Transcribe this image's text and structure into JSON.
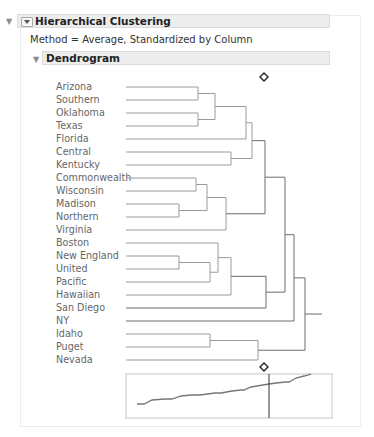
{
  "report": {
    "outer_disclosure_icon": "triangle-down-icon",
    "title": "Hierarchical Clustering",
    "method_text": "Method = Average, Standardized by Column",
    "dendrogram_title": "Dendrogram"
  },
  "chart_data": {
    "type": "dendrogram",
    "title": "Dendrogram",
    "method": "Average, Standardized by Column",
    "leaves": [
      "Arizona",
      "Southern",
      "Oklahoma",
      "Texas",
      "Florida",
      "Central",
      "Kentucky",
      "Commonwealth",
      "Wisconsin",
      "Madison",
      "Northern",
      "Virginia",
      "Boston",
      "New England",
      "United",
      "Pacific",
      "Hawaiian",
      "San Diego",
      "NY",
      "Idaho",
      "Puget",
      "Nevada"
    ],
    "merges": [
      {
        "children": [
          "Arizona",
          "Southern"
        ],
        "height_px": 198
      },
      {
        "children": [
          "Oklahoma",
          "Texas"
        ],
        "height_px": 198
      },
      {
        "children": [
          "Arizona+Southern",
          "Oklahoma+Texas"
        ],
        "height_px": 215
      },
      {
        "children": [
          "AZ-TX group",
          "Florida"
        ],
        "height_px": 246
      },
      {
        "children": [
          "Central",
          "Kentucky"
        ],
        "height_px": 231
      },
      {
        "children": [
          "AZ-FL group",
          "Central+Kentucky"
        ],
        "height_px": 252
      },
      {
        "children": [
          "Commonwealth",
          "Wisconsin"
        ],
        "height_px": 196
      },
      {
        "children": [
          "Madison",
          "Northern"
        ],
        "height_px": 179
      },
      {
        "children": [
          "Commonwealth+Wisconsin",
          "Madison+Northern"
        ],
        "height_px": 207
      },
      {
        "children": [
          "CW-NO group",
          "Virginia"
        ],
        "height_px": 226
      },
      {
        "children": [
          "AZ-KY group",
          "CW-VA group"
        ],
        "height_px": 265
      },
      {
        "children": [
          "New England",
          "United"
        ],
        "height_px": 179
      },
      {
        "children": [
          "New England+United",
          "Pacific"
        ],
        "height_px": 210
      },
      {
        "children": [
          "Boston",
          "NE-PA group"
        ],
        "height_px": 218
      },
      {
        "children": [
          "BO-PA group",
          "Hawaiian"
        ],
        "height_px": 231
      },
      {
        "children": [
          "BO-HA group",
          "San Diego"
        ],
        "height_px": 266
      },
      {
        "children": [
          "AZ-VA group",
          "BO-SD group"
        ],
        "height_px": 285
      },
      {
        "children": [
          "AZ-SD group",
          "NY"
        ],
        "height_px": 294
      },
      {
        "children": [
          "Idaho",
          "Puget"
        ],
        "height_px": 210
      },
      {
        "children": [
          "Idaho+Puget",
          "Nevada"
        ],
        "height_px": 258
      },
      {
        "children": [
          "AZ-NY group",
          "ID-NV group"
        ],
        "height_px": 305
      }
    ],
    "cluster_marker": {
      "shape": "diamond",
      "position": "cut at 2 clusters"
    },
    "distance_graph": {
      "type": "line",
      "description": "Clustering distance (scree-like) plot, increasing",
      "points": [
        [
          137,
          404
        ],
        [
          144,
          404
        ],
        [
          152,
          400
        ],
        [
          165,
          399
        ],
        [
          172,
          399
        ],
        [
          181,
          396
        ],
        [
          191,
          395
        ],
        [
          200,
          395
        ],
        [
          215,
          393
        ],
        [
          221,
          393
        ],
        [
          232,
          391
        ],
        [
          241,
          390
        ],
        [
          244,
          390
        ],
        [
          251,
          387
        ],
        [
          257,
          386
        ],
        [
          263,
          385
        ],
        [
          269,
          384
        ],
        [
          276,
          383
        ],
        [
          286,
          382
        ],
        [
          289,
          382
        ],
        [
          296,
          378
        ],
        [
          304,
          376
        ],
        [
          311,
          374
        ]
      ],
      "cut_line_x": 269
    },
    "colors": {
      "line": "#8a8a8a",
      "upper_links": "#9a9a9a",
      "root_links": "#6d6d6d"
    }
  }
}
